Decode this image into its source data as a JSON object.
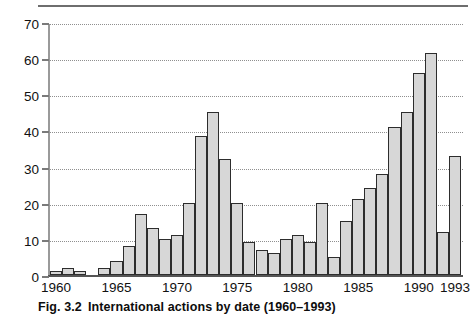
{
  "caption": {
    "figure_number": "Fig. 3.2",
    "text": "International actions by date (1960–1993)"
  },
  "chart_data": {
    "type": "bar",
    "title": "International actions by date (1960–1993)",
    "xlabel": "",
    "ylabel": "",
    "ylim": [
      0,
      70
    ],
    "ytick_step": 10,
    "yticks": [
      0,
      10,
      20,
      30,
      40,
      50,
      60,
      70
    ],
    "ytick_labels": [
      "0",
      "10",
      "20",
      "30",
      "40",
      "50",
      "60",
      "70"
    ],
    "xticks": [
      1960,
      1965,
      1970,
      1975,
      1980,
      1985,
      1990,
      1993
    ],
    "xtick_labels": [
      "1960",
      "1965",
      "1970",
      "1975",
      "1980",
      "1985",
      "1990",
      "1993"
    ],
    "grid": "horizontal-dotted",
    "legend": "none",
    "bar_fill_color": "#d7d7d7",
    "bar_edge_color": "#2d2d2d",
    "gridline_color": "#8f8f8f",
    "categories": [
      "1960",
      "1961",
      "1962",
      "1963",
      "1964",
      "1965",
      "1966",
      "1967",
      "1968",
      "1969",
      "1970",
      "1971",
      "1972",
      "1973",
      "1974",
      "1975",
      "1976",
      "1977",
      "1978",
      "1979",
      "1980",
      "1981",
      "1982",
      "1983",
      "1984",
      "1985",
      "1986",
      "1987",
      "1988",
      "1989",
      "1990",
      "1991",
      "1992",
      "1993"
    ],
    "values": [
      1,
      2,
      1,
      0,
      2,
      4,
      8,
      17,
      13,
      10,
      11,
      20,
      38.5,
      45,
      32,
      20,
      9,
      7,
      6,
      10,
      11,
      9,
      20,
      5,
      15,
      21,
      24,
      28,
      41,
      45,
      56,
      61.5,
      12,
      33
    ]
  }
}
